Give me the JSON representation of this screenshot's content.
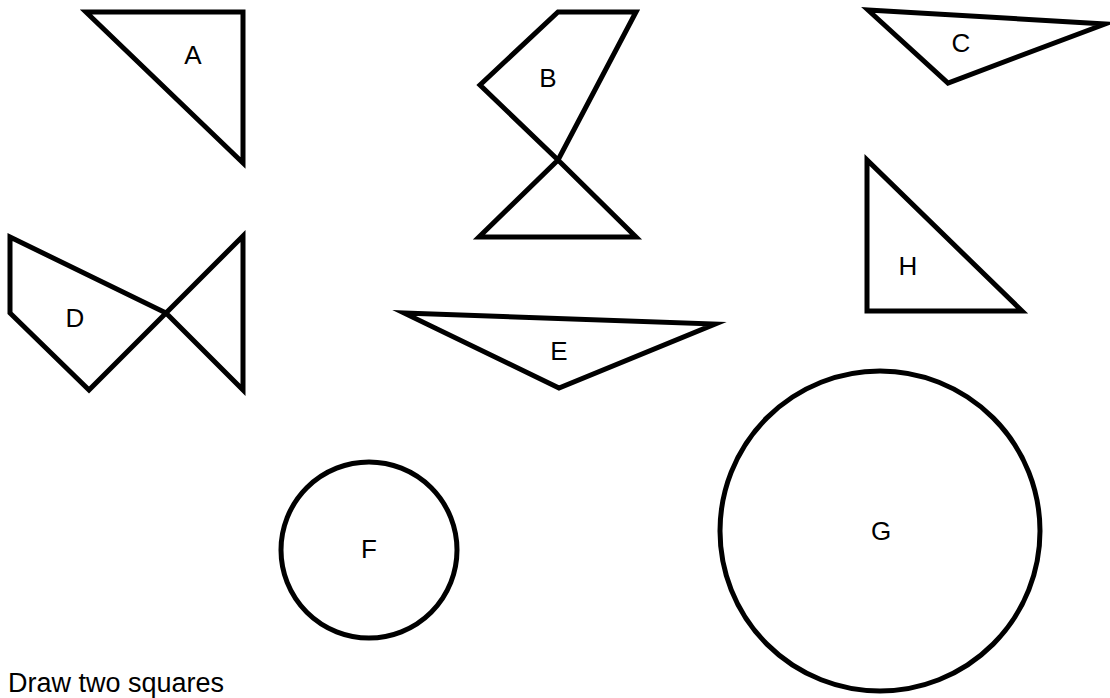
{
  "instruction": "Draw two squares",
  "colors": {
    "background": "#ffffff",
    "stroke": "#000000"
  },
  "shapes": [
    {
      "id": "A",
      "label": "A",
      "kind": "triangle",
      "points": "86,12 243,12 243,163",
      "label_pos": [
        193,
        57
      ]
    },
    {
      "id": "B",
      "label": "B",
      "kind": "crossed-polygon",
      "points": "558,12 636,12 558,160 636,237 479,237 558,160 480,85",
      "label_pos": [
        548,
        80
      ]
    },
    {
      "id": "C",
      "label": "C",
      "kind": "triangle",
      "points": "868,10 1105,24 948,83",
      "label_pos": [
        961,
        45
      ]
    },
    {
      "id": "D",
      "label": "D",
      "kind": "crossed-polygon",
      "points": "10,237 10,313 89,390 166,313 243,390 243,236 166,313 10,237",
      "label_pos": [
        75,
        320
      ]
    },
    {
      "id": "E",
      "label": "E",
      "kind": "triangle",
      "points": "404,313 715,324 559,388",
      "label_pos": [
        559,
        353
      ]
    },
    {
      "id": "F",
      "label": "F",
      "kind": "circle",
      "cx": 369,
      "cy": 550,
      "r": 88,
      "label_pos": [
        369,
        551
      ]
    },
    {
      "id": "G",
      "label": "G",
      "kind": "circle",
      "cx": 880,
      "cy": 531,
      "r": 160,
      "label_pos": [
        881,
        533
      ]
    },
    {
      "id": "H",
      "label": "H",
      "kind": "triangle",
      "points": "867,160 867,311 1022,311",
      "label_pos": [
        908,
        268
      ]
    }
  ]
}
